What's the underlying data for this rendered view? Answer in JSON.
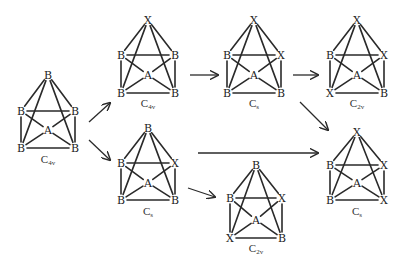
{
  "diagram": {
    "title": "",
    "structures": [
      {
        "id": "s1",
        "cx": 48,
        "top": 75,
        "w": 27,
        "uy": 111,
        "ly": 148,
        "ay": 130,
        "labelY": 163,
        "atoms": {
          "top": "B",
          "ul": "B",
          "ur": "B",
          "ll": "B",
          "lr": "B",
          "center": "A"
        },
        "symmetry": {
          "main": "C",
          "sub": "4v"
        }
      },
      {
        "id": "s2",
        "cx": 148,
        "top": 20,
        "w": 27,
        "uy": 55,
        "ly": 93,
        "ay": 75,
        "labelY": 107,
        "atoms": {
          "top": "X",
          "ul": "B",
          "ur": "B",
          "ll": "B",
          "lr": "B",
          "center": "A"
        },
        "symmetry": {
          "main": "C",
          "sub": "4v"
        }
      },
      {
        "id": "s3",
        "cx": 254,
        "top": 20,
        "w": 27,
        "uy": 55,
        "ly": 93,
        "ay": 75,
        "labelY": 107,
        "atoms": {
          "top": "X",
          "ul": "B",
          "ur": "X",
          "ll": "B",
          "lr": "B",
          "center": "A"
        },
        "symmetry": {
          "main": "C",
          "sub": "s"
        }
      },
      {
        "id": "s4",
        "cx": 357,
        "top": 20,
        "w": 27,
        "uy": 55,
        "ly": 93,
        "ay": 75,
        "labelY": 107,
        "atoms": {
          "top": "X",
          "ul": "B",
          "ur": "X",
          "ll": "X",
          "lr": "B",
          "center": "A"
        },
        "symmetry": {
          "main": "C",
          "sub": "2v"
        }
      },
      {
        "id": "s5",
        "cx": 148,
        "top": 128,
        "w": 27,
        "uy": 163,
        "ly": 200,
        "ay": 183,
        "labelY": 215,
        "atoms": {
          "top": "B",
          "ul": "B",
          "ur": "X",
          "ll": "B",
          "lr": "B",
          "center": "A"
        },
        "symmetry": {
          "main": "C",
          "sub": "s"
        }
      },
      {
        "id": "s6",
        "cx": 256,
        "top": 165,
        "w": 26,
        "uy": 198,
        "ly": 238,
        "ay": 220,
        "labelY": 252,
        "atoms": {
          "top": "B",
          "ul": "B",
          "ur": "X",
          "ll": "X",
          "lr": "B",
          "center": "A"
        },
        "symmetry": {
          "main": "C",
          "sub": "2v"
        }
      },
      {
        "id": "s7",
        "cx": 357,
        "top": 132,
        "w": 27,
        "uy": 165,
        "ly": 200,
        "ay": 183,
        "labelY": 215,
        "atoms": {
          "top": "X",
          "ul": "B",
          "ur": "X",
          "ll": "B",
          "lr": "X",
          "center": "A"
        },
        "symmetry": {
          "main": "C",
          "sub": "s"
        }
      }
    ],
    "arrows": [
      {
        "from": "s1",
        "to": "s2",
        "x1": 89,
        "y1": 122,
        "x2": 110,
        "y2": 103
      },
      {
        "from": "s1",
        "to": "s5",
        "x1": 89,
        "y1": 140,
        "x2": 110,
        "y2": 160
      },
      {
        "from": "s2",
        "to": "s3",
        "x1": 190,
        "y1": 75,
        "x2": 218,
        "y2": 75
      },
      {
        "from": "s3",
        "to": "s4",
        "x1": 293,
        "y1": 75,
        "x2": 318,
        "y2": 75
      },
      {
        "from": "s3",
        "to": "s7",
        "x1": 300,
        "y1": 102,
        "x2": 328,
        "y2": 130
      },
      {
        "from": "s5",
        "to": "s7",
        "x1": 198,
        "y1": 153,
        "x2": 318,
        "y2": 153
      },
      {
        "from": "s5",
        "to": "s6",
        "x1": 188,
        "y1": 188,
        "x2": 215,
        "y2": 197
      }
    ]
  }
}
